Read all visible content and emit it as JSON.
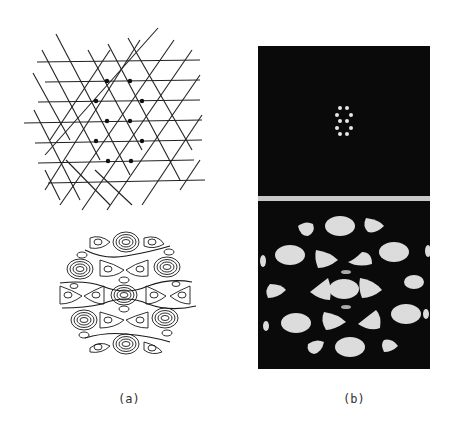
{
  "figure": {
    "panel_a": {
      "label": "(a)",
      "top_diagram": "triangular lattice of three sets of intersecting straight lines with dark dots at a hexagonal ring of intersections",
      "bottom_diagram": "circular contour map of interference pattern with concentric oval and triangular contours"
    },
    "panel_b": {
      "label": "(b)",
      "top_image": "dark field with hexagonal ring of bright diffraction spots",
      "bottom_image": "dark field with bright oval and triangular blobs in hexagonal arrangement"
    },
    "colors": {
      "background": "#ffffff",
      "ink": "#1a1a1a",
      "photo_dark": "#0a0a0a",
      "photo_bright": "#dcdcdc",
      "separator": "#c8c8c8"
    }
  }
}
